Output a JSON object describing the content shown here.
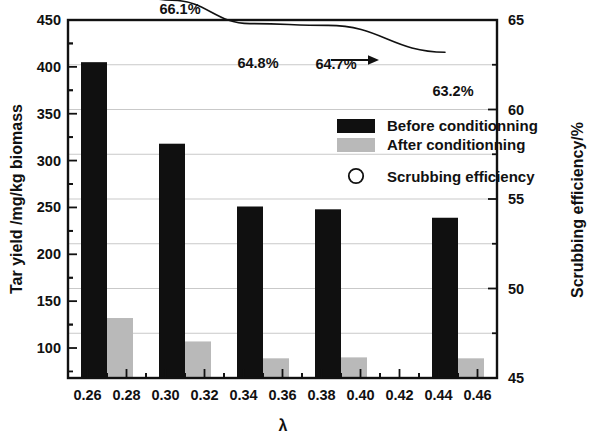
{
  "chart_data": {
    "type": "bar",
    "title": "",
    "xlabel": "λ",
    "ylabel": "Tar yield /mg/kg biomass",
    "y2label": "Scrubbing efficiency/%",
    "xlim": [
      0.25,
      0.47
    ],
    "ylim": [
      68,
      450
    ],
    "y2lim": [
      45,
      65
    ],
    "grid": true,
    "legend_position": "upper-right-inside",
    "x_ticks": [
      "0.26",
      "0.28",
      "0.30",
      "0.32",
      "0.34",
      "0.36",
      "0.38",
      "0.40",
      "0.42",
      "0.44",
      "0.46"
    ],
    "x_tick_values": [
      0.26,
      0.28,
      0.3,
      0.32,
      0.34,
      0.36,
      0.38,
      0.4,
      0.42,
      0.44,
      0.46
    ],
    "y_ticks": [
      "100",
      "150",
      "200",
      "250",
      "300",
      "350",
      "400",
      "450"
    ],
    "y_tick_values": [
      100,
      150,
      200,
      250,
      300,
      350,
      400,
      450
    ],
    "y2_ticks": [
      "45",
      "50",
      "55",
      "60",
      "65"
    ],
    "y2_tick_values": [
      45,
      50,
      55,
      60,
      65
    ],
    "categories": [
      0.27,
      0.31,
      0.35,
      0.39,
      0.45
    ],
    "series": [
      {
        "name": "Before conditionning",
        "color": "#101010",
        "values": [
          405,
          318,
          251,
          248,
          239
        ]
      },
      {
        "name": "After conditionning",
        "color": "#b9b9b9",
        "values": [
          132,
          107,
          89,
          90,
          89
        ]
      },
      {
        "name": "Scrubbing efficiency",
        "color": "#101010",
        "values": [
          67.3,
          66.1,
          64.8,
          64.7,
          63.2
        ]
      }
    ],
    "annotations": [
      "67.3%",
      "66.1%",
      "64.8%",
      "64.7%",
      "63.2%"
    ],
    "arrow_annotation": "right-arrow-to-secondary-axis"
  },
  "legend": {
    "items": [
      {
        "label": "Before conditionning",
        "marker": "filled-black-rect"
      },
      {
        "label": "After conditionning",
        "marker": "filled-gray-rect"
      },
      {
        "label": "Scrubbing efficiency",
        "marker": "open-circle"
      }
    ]
  },
  "axes": {
    "y_left_title": "Tar yield /mg/kg biomass",
    "y_right_title": "Scrubbing efficiency/%",
    "x_title": "λ"
  },
  "colors": {
    "before": "#101010",
    "after": "#b9b9b9",
    "grid": "#c9c9c9",
    "frame": "#111111",
    "background": "#ffffff"
  }
}
